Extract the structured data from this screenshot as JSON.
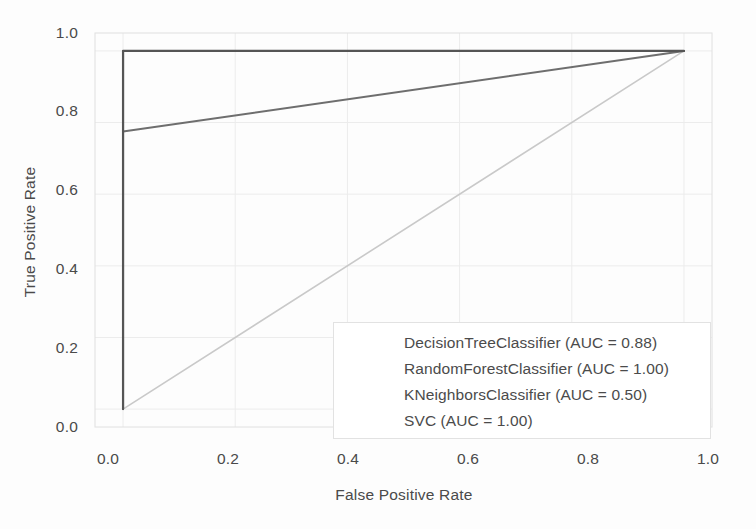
{
  "chart_data": {
    "type": "line",
    "title": "",
    "xlabel": "False Positive Rate",
    "ylabel": "True Positive Rate",
    "xlim": [
      -0.05,
      1.05
    ],
    "ylim": [
      -0.05,
      1.05
    ],
    "xticks": [
      "0.0",
      "0.2",
      "0.4",
      "0.6",
      "0.8",
      "1.0"
    ],
    "xtick_values": [
      0.0,
      0.2,
      0.4,
      0.6,
      0.8,
      1.0
    ],
    "yticks": [
      "0.0",
      "0.2",
      "0.4",
      "0.6",
      "0.8",
      "1.0"
    ],
    "ytick_values": [
      0.0,
      0.2,
      0.4,
      0.6,
      0.8,
      1.0
    ],
    "grid": true,
    "legend_position": "lower right",
    "series": [
      {
        "name": "DecisionTreeClassifier (AUC = 0.88)",
        "model": "DecisionTreeClassifier",
        "auc": "0.88",
        "color": "#6e6e6e",
        "linewidth": 2.0,
        "x": [
          0.0,
          1.0
        ],
        "y": [
          0.775,
          1.0
        ]
      },
      {
        "name": "RandomForestClassifier (AUC = 1.00)",
        "model": "RandomForestClassifier",
        "auc": "1.00",
        "color": "#5f5f5f",
        "linewidth": 2.0,
        "x": [
          0.0,
          0.0,
          1.0
        ],
        "y": [
          0.0,
          1.0,
          1.0
        ]
      },
      {
        "name": "KNeighborsClassifier (AUC = 0.50)",
        "model": "KNeighborsClassifier",
        "auc": "0.50",
        "color": "#c9c9c9",
        "linewidth": 1.6,
        "x": [
          0.0,
          1.0
        ],
        "y": [
          0.0,
          1.0
        ]
      },
      {
        "name": "SVC (AUC = 1.00)",
        "model": "SVC",
        "auc": "1.00",
        "color": "#555555",
        "linewidth": 2.2,
        "x": [
          0.0,
          0.0,
          1.0
        ],
        "y": [
          0.0,
          1.0,
          1.0
        ]
      }
    ]
  },
  "legend": {
    "entries": [
      "DecisionTreeClassifier (AUC = 0.88)",
      "RandomForestClassifier (AUC = 1.00)",
      "KNeighborsClassifier (AUC = 0.50)",
      "SVC (AUC = 1.00)"
    ]
  },
  "colors": {
    "background": "#ffffff",
    "text": "#4a4a4a",
    "grid": "#ececec",
    "frame": "#e0e0e0",
    "legend_border": "#e2e2e2"
  }
}
